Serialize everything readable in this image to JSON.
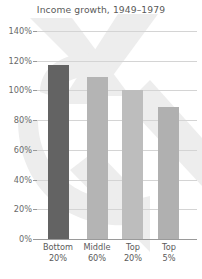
{
  "chart_data": {
    "type": "bar",
    "title": "Income growth, 1949–1979",
    "xlabel": "",
    "ylabel": "",
    "categories": [
      "Bottom 20%",
      "Middle 60%",
      "Top 20%",
      "Top 5%"
    ],
    "category_lines": [
      {
        "line1": "Bottom",
        "line2": "20%"
      },
      {
        "line1": "Middle",
        "line2": "60%"
      },
      {
        "line1": "Top",
        "line2": "20%"
      },
      {
        "line1": "Top",
        "line2": "5%"
      }
    ],
    "values": [
      117,
      109,
      100,
      89
    ],
    "value_labels": [
      "117%",
      "109%",
      "100%",
      "89%"
    ],
    "ylim": [
      0,
      140
    ],
    "ytick_values": [
      0,
      20,
      40,
      60,
      80,
      100,
      120,
      140
    ],
    "ytick_labels": [
      "0%",
      "20%",
      "40%",
      "60%",
      "80%",
      "100%",
      "120%",
      "140%"
    ],
    "grid": true,
    "legend": false,
    "bar_colors": [
      "#636363",
      "#b4b4b4",
      "#bdbdbd",
      "#b0b0b0"
    ],
    "colors": {
      "background": "#ffffff",
      "gridline": "#d4d4d4",
      "axis": "#9a9a9a",
      "title_text": "#5a5a5a",
      "tick_text": "#6a6a6a",
      "watermark": "#ededed"
    }
  }
}
